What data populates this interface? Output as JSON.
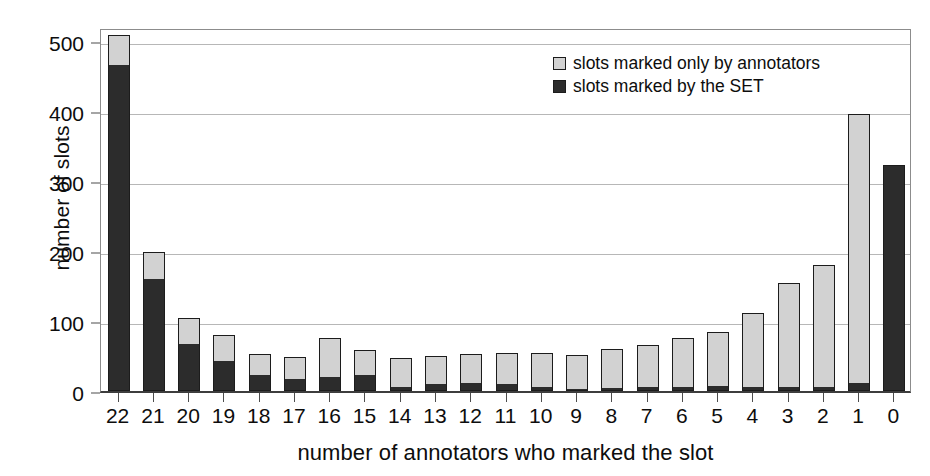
{
  "chart_data": {
    "type": "bar",
    "subtype": "stacked-vertical",
    "title": "",
    "xlabel": "number of annotators who marked the slot",
    "ylabel": "number of slots",
    "categories": [
      "22",
      "21",
      "20",
      "19",
      "18",
      "17",
      "16",
      "15",
      "14",
      "13",
      "12",
      "11",
      "10",
      "9",
      "8",
      "7",
      "6",
      "5",
      "4",
      "3",
      "2",
      "1",
      "0"
    ],
    "series": [
      {
        "name": "slots marked by the SET",
        "color": "#2c2c2c",
        "values": [
          465,
          158,
          66,
          42,
          22,
          16,
          19,
          21,
          4,
          9,
          10,
          8,
          5,
          2,
          3,
          4,
          4,
          6,
          4,
          4,
          4,
          10,
          320
        ]
      },
      {
        "name": "slots marked only by annotators",
        "color": "#d2d2d2",
        "values": [
          41,
          38,
          36,
          35,
          28,
          30,
          54,
          35,
          40,
          38,
          40,
          44,
          46,
          47,
          54,
          59,
          69,
          76,
          104,
          147,
          173,
          383,
          0
        ]
      }
    ],
    "totals": [
      506,
      196,
      102,
      77,
      50,
      46,
      73,
      56,
      44,
      47,
      50,
      52,
      51,
      49,
      57,
      63,
      73,
      82,
      108,
      151,
      177,
      393,
      320
    ],
    "yticks": [
      0,
      100,
      200,
      300,
      400,
      500
    ],
    "ylim": [
      0,
      520
    ],
    "grid": "horizontal",
    "legend_position": "top-right"
  },
  "legend": {
    "items": [
      {
        "label": "slots marked only by annotators",
        "swatch": "annot"
      },
      {
        "label": "slots marked by the SET",
        "swatch": "set"
      }
    ]
  },
  "colors": {
    "annotators": "#d2d2d2",
    "set": "#2c2c2c",
    "grid": "#b7b7b7",
    "frame": "#8c8c8c",
    "axis": "#3d3d3d",
    "text": "#0d0d0d",
    "background": "#ffffff"
  }
}
